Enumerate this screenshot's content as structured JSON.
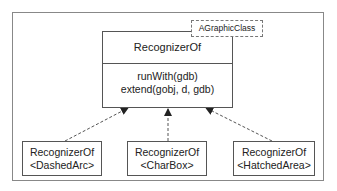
{
  "diagram": {
    "type": "uml-class-template",
    "main_class": {
      "name": "RecognizerOf",
      "operations": [
        "runWith(gdb)",
        "extend(gobj, d, gdb)"
      ],
      "template_parameter": "AGraphicClass"
    },
    "bound_classes": [
      {
        "name": "RecognizerOf",
        "binding": "<DashedArc>"
      },
      {
        "name": "RecognizerOf",
        "binding": "<CharBox>"
      },
      {
        "name": "RecognizerOf",
        "binding": "<HatchedArea>"
      }
    ],
    "relation": "dashed-realization-arrow",
    "colors": {
      "line": "#555555",
      "frame": "#888888"
    }
  }
}
